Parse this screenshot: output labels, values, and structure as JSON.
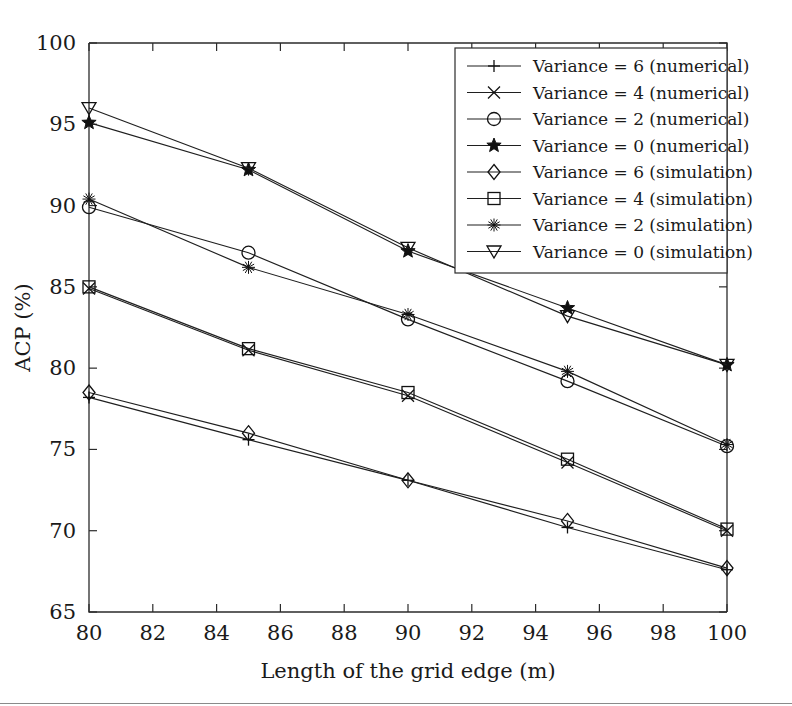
{
  "figure": {
    "background_color": "#ffffff",
    "line_color": "#1f1f1f",
    "axis_color": "#2b2b2b"
  },
  "chart_data": {
    "type": "line",
    "title": "",
    "xlabel": "Length of the grid edge (m)",
    "ylabel": "ACP (%)",
    "x": [
      80,
      85,
      90,
      95,
      100
    ],
    "xlim": [
      80,
      100
    ],
    "ylim": [
      65,
      100
    ],
    "xticks": [
      80,
      82,
      84,
      86,
      88,
      90,
      92,
      94,
      96,
      98,
      100
    ],
    "xticklabels": [
      "80",
      "82",
      "84",
      "86",
      "88",
      "90",
      "92",
      "94",
      "96",
      "98",
      "100"
    ],
    "yticks": [
      65,
      70,
      75,
      80,
      85,
      90,
      95,
      100
    ],
    "yticklabels": [
      "65",
      "70",
      "75",
      "80",
      "85",
      "90",
      "95",
      "100"
    ],
    "grid": false,
    "legend_position": "upper right",
    "series": [
      {
        "name": "Variance = 6 (numerical)",
        "marker": "plus",
        "values": [
          78.2,
          75.6,
          73.1,
          70.2,
          67.6
        ]
      },
      {
        "name": "Variance = 4 (numerical)",
        "marker": "x",
        "values": [
          84.9,
          81.1,
          78.3,
          74.2,
          70.0
        ]
      },
      {
        "name": "Variance = 2 (numerical)",
        "marker": "circle",
        "values": [
          89.9,
          87.1,
          83.0,
          79.2,
          75.2
        ]
      },
      {
        "name": "Variance = 0 (numerical)",
        "marker": "star",
        "values": [
          95.1,
          92.2,
          87.2,
          83.7,
          80.2
        ]
      },
      {
        "name": "Variance = 6 (simulation)",
        "marker": "diamond",
        "values": [
          78.5,
          76.0,
          73.1,
          70.6,
          67.7
        ]
      },
      {
        "name": "Variance = 4 (simulation)",
        "marker": "square",
        "values": [
          85.0,
          81.2,
          78.5,
          74.4,
          70.1
        ]
      },
      {
        "name": "Variance = 2 (simulation)",
        "marker": "asterisk",
        "values": [
          90.4,
          86.2,
          83.3,
          79.8,
          75.3
        ]
      },
      {
        "name": "Variance = 0 (simulation)",
        "marker": "triangle-down",
        "values": [
          96.0,
          92.3,
          87.4,
          83.2,
          80.2
        ]
      }
    ]
  }
}
